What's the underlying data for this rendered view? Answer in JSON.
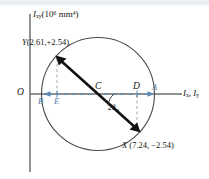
{
  "figure": {
    "type": "mohrs-circle-moments-of-inertia",
    "axes": {
      "vertical_label_symbol": "I",
      "vertical_label_sub": "xy",
      "vertical_label_units_base": "(10",
      "vertical_label_units_exp": "6",
      "vertical_label_units_tail": " mm",
      "vertical_label_units_tail_exp": "4",
      "vertical_label_close": ")",
      "vertical_label_full": "Ixy(10^6 mm^4)",
      "horizontal_label_1_symbol": "I",
      "horizontal_label_1_sub": "x",
      "horizontal_label_sep": ", ",
      "horizontal_label_2_symbol": "I",
      "horizontal_label_2_sub": "y",
      "horizontal_label_full": "Ix, Iy",
      "origin_label": "O"
    },
    "points": {
      "Y": {
        "label": "Y",
        "coords_text": "(2.61,+2.54)",
        "x_value": 2.61,
        "y_value": 2.54,
        "px": 57,
        "py": 57
      },
      "X": {
        "label": "X",
        "coords_text": "(7.24, −2.54)",
        "x_value": 7.24,
        "y_value": -2.54,
        "px": 139,
        "py": 131
      },
      "C": {
        "label": "C",
        "px": 98,
        "py": 94
      },
      "D": {
        "label": "D",
        "px": 135,
        "py": 94
      },
      "E": {
        "label": "E",
        "px": 62,
        "py": 94
      },
      "A": {
        "label": "A",
        "px": 155,
        "py": 94
      },
      "B": {
        "label": "B",
        "px": 42,
        "py": 94
      }
    },
    "angle": {
      "label_symbol": "2θ",
      "label_sub": "m",
      "label_full": "2θm"
    },
    "circle": {
      "cx": 98,
      "cy": 94,
      "r": 56.5
    },
    "colors": {
      "axis": "#6b6f72",
      "circle": "#4a4a4a",
      "diameter_line": "#111111",
      "dimension_blue": "#5b8bb5",
      "projection_dash": "#a9a9a9",
      "background": "#ffffff",
      "top_band": "#eef1f4"
    }
  }
}
